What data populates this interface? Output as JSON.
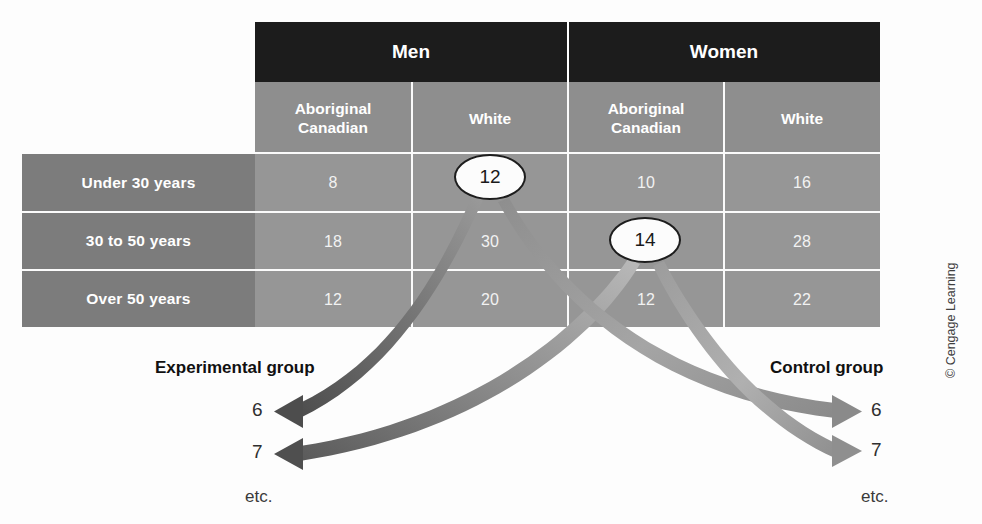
{
  "figure": {
    "type": "diagram-random-assignment-table",
    "copyright": "© Cengage Learning"
  },
  "table": {
    "top_headers": [
      {
        "label": "Men",
        "colspan": 2
      },
      {
        "label": "Women",
        "colspan": 2
      }
    ],
    "sub_headers": [
      "Aboriginal\nCanadian",
      "White",
      "Aboriginal\nCanadian",
      "White"
    ],
    "sub_headers_lines": [
      [
        "Aboriginal",
        "Canadian"
      ],
      [
        "White",
        ""
      ],
      [
        "Aboriginal",
        "Canadian"
      ],
      [
        "White",
        ""
      ]
    ],
    "row_labels": [
      "Under 30 years",
      "30 to 50 years",
      "Over 50 years"
    ],
    "rows": [
      {
        "label": "Under 30 years",
        "values": [
          "8",
          "12",
          "10",
          "16"
        ]
      },
      {
        "label": "30 to 50 years",
        "values": [
          "18",
          "30",
          "14",
          "28"
        ]
      },
      {
        "label": "Over 50 years",
        "values": [
          "12",
          "20",
          "12",
          "22"
        ]
      }
    ]
  },
  "callouts": [
    {
      "id": "callout-12",
      "value": "12",
      "source_cell": "Men / White / Under 30 years"
    },
    {
      "id": "callout-14",
      "value": "14",
      "source_cell": "Women / Aboriginal Canadian / 30 to 50 years"
    }
  ],
  "groups": {
    "experimental": {
      "title": "Experimental group",
      "items": [
        "6",
        "7"
      ],
      "etc": "etc."
    },
    "control": {
      "title": "Control group",
      "items": [
        "6",
        "7"
      ],
      "etc": "etc."
    }
  },
  "colors": {
    "header_dark": "#1c1c1c",
    "subheader_gray": "#8e8e8e",
    "body_gray": "#969696",
    "rowlabel_gray": "#7c7c7c",
    "grid_white": "#fbfbfb",
    "arrow_dark": "#5c5c5c",
    "arrow_light": "#b4b4b4",
    "page_bg": "#fdfdfd"
  }
}
